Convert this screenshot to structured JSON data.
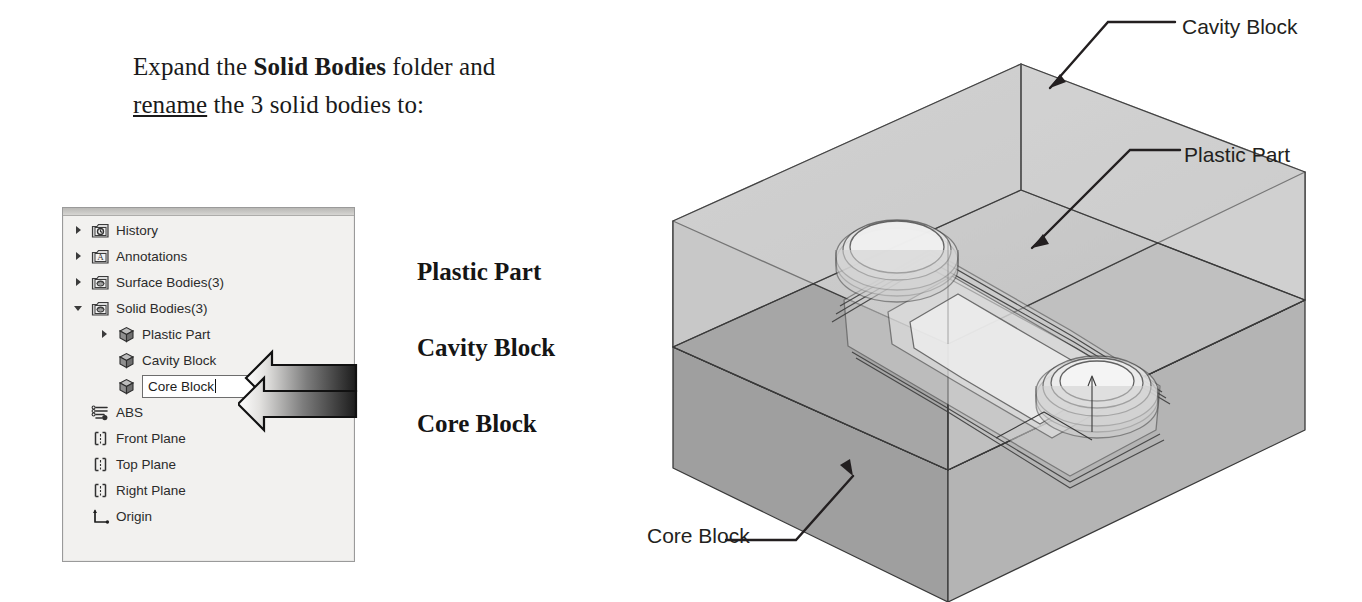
{
  "instruction": {
    "line1_pre": "Expand the ",
    "line1_bold": "Solid Bodies",
    "line1_post": " folder and",
    "line2_underline": "rename",
    "line2_post": " the 3 solid bodies to:"
  },
  "tree": {
    "items": [
      {
        "label": "History",
        "icon": "history-folder-icon",
        "twisty": "right",
        "indent": 0
      },
      {
        "label": "Annotations",
        "icon": "annotations-folder-icon",
        "twisty": "right",
        "indent": 0
      },
      {
        "label": "Surface Bodies(3)",
        "icon": "surface-bodies-folder-icon",
        "twisty": "right",
        "indent": 0
      },
      {
        "label": "Solid Bodies(3)",
        "icon": "solid-bodies-folder-icon",
        "twisty": "down",
        "indent": 0
      },
      {
        "label": "Plastic Part",
        "icon": "solid-body-cube-icon",
        "twisty": "right",
        "indent": 1
      },
      {
        "label": "Cavity Block",
        "icon": "solid-body-cube-icon",
        "twisty": "none",
        "indent": 1
      },
      {
        "label": "Core Block",
        "icon": "solid-body-cube-icon",
        "twisty": "none",
        "indent": 1,
        "editing": true
      },
      {
        "label": "ABS",
        "icon": "material-icon",
        "twisty": "none",
        "indent": 0
      },
      {
        "label": "Front Plane",
        "icon": "plane-icon",
        "twisty": "none",
        "indent": 0
      },
      {
        "label": "Top Plane",
        "icon": "plane-icon",
        "twisty": "none",
        "indent": 0
      },
      {
        "label": "Right Plane",
        "icon": "plane-icon",
        "twisty": "none",
        "indent": 0
      },
      {
        "label": "Origin",
        "icon": "origin-icon",
        "twisty": "none",
        "indent": 0
      }
    ],
    "rename_field_value": "Core Block"
  },
  "body_names": {
    "plastic": "Plastic Part",
    "cavity": "Cavity Block",
    "core": "Core Block"
  },
  "callouts": {
    "cavity": "Cavity Block",
    "plastic": "Plastic Part",
    "core": "Core Block"
  },
  "colors": {
    "page_background": "#ffffff",
    "panel_background": "#f2f1ef",
    "panel_border": "#9a9a9a",
    "text": "#2b2b2b",
    "heading_text": "#1a1a1a",
    "callout_text": "#231f20",
    "block_top_face": "#c9c9c9",
    "block_left_face": "#a8a8a8",
    "block_right_face": "#bdbdbd",
    "block_dark_face": "#9a9a9a",
    "block_outline": "#3a3a3a",
    "arrow_gradient_from": "#ffffff",
    "arrow_gradient_to": "#1c1c1c"
  }
}
